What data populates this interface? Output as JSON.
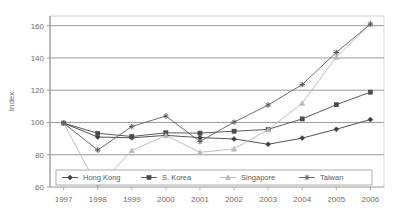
{
  "chart_data": {
    "type": "line",
    "title": "",
    "subtitle": "",
    "xlabel": "",
    "ylabel": "Index",
    "x": [
      1997,
      1998,
      1999,
      2000,
      2001,
      2002,
      2003,
      2004,
      2005,
      2006
    ],
    "xtick_labels": [
      "1997",
      "1998",
      "1999",
      "2000",
      "2001",
      "2002",
      "2003",
      "2004",
      "2005",
      "2006"
    ],
    "ytick_labels": [
      "60",
      "80",
      "100",
      "120",
      "140",
      "160"
    ],
    "yticks": [
      60,
      80,
      100,
      120,
      140,
      160
    ],
    "ylim": [
      60,
      166
    ],
    "xlim": [
      1996.6,
      2006.4
    ],
    "grid": "horizontal",
    "legend_position": "bottom-inside",
    "series": [
      {
        "name": "Hong Kong",
        "marker": "diamond",
        "color": "#3f3f3f",
        "linestyle": "solid",
        "values": [
          99.6,
          91.0,
          90.5,
          92.0,
          90.6,
          89.8,
          86.5,
          90.3,
          95.8,
          101.8
        ]
      },
      {
        "name": "S. Korea",
        "marker": "square",
        "color": "#4a4a4a",
        "linestyle": "solid",
        "values": [
          99.6,
          93.3,
          91.3,
          93.6,
          93.4,
          94.6,
          95.7,
          102.2,
          111.0,
          118.8
        ]
      },
      {
        "name": "Singapore",
        "marker": "triangle",
        "color": "#b8b8b8",
        "linestyle": "solid",
        "values": [
          99.6,
          60.0,
          82.6,
          92.0,
          81.5,
          83.6,
          95.5,
          112.0,
          140.5,
          161.0
        ]
      },
      {
        "name": "Taiwan",
        "marker": "cross",
        "color": "#5c5c5c",
        "linestyle": "solid",
        "values": [
          99.6,
          82.9,
          97.5,
          104.0,
          88.2,
          100.2,
          110.8,
          123.5,
          143.4,
          161.0
        ]
      }
    ]
  },
  "legend": {
    "entries": [
      {
        "label": "Hong Kong"
      },
      {
        "label": "S. Korea"
      },
      {
        "label": "Singapore"
      },
      {
        "label": "Taiwan"
      }
    ]
  }
}
